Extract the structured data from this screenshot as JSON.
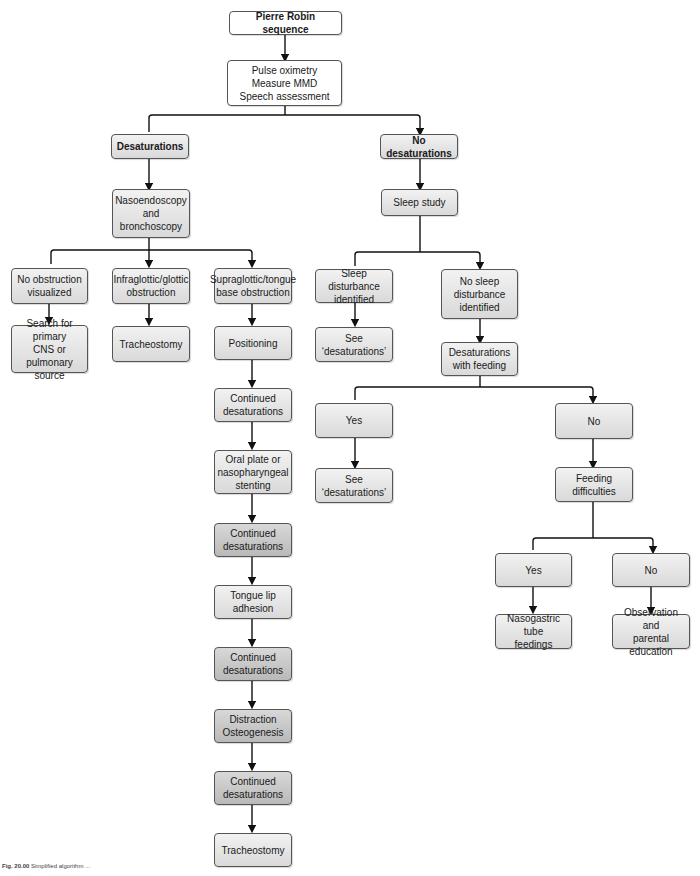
{
  "diagram": {
    "nodes": {
      "root": "Pierre Robin sequence",
      "assess": "Pulse oximetry\nMeasure MMD\nSpeech assessment",
      "desat": "Desaturations",
      "nodesat": "No desaturations",
      "naso": "Nasoendoscopy\nand\nbronchoscopy",
      "noobs": "No obstruction\nvisualized",
      "infra": "Infraglottic/glottic\nobstruction",
      "supra": "Supraglottic/tongue\nbase obstruction",
      "search": "Search for primary\nCNS or\npulmonary source",
      "trach1": "Tracheostomy",
      "position": "Positioning",
      "cont1": "Continued\ndesaturations",
      "oral": "Oral plate or\nnasopharyngeal\nstenting",
      "cont2": "Continued\ndesaturations",
      "tla": "Tongue lip\nadhesion",
      "cont3": "Continued\ndesaturations",
      "distraction": "Distraction\nOsteogenesis",
      "cont4": "Continued\ndesaturations",
      "trach2": "Tracheostomy",
      "sleep": "Sleep study",
      "sleepdist": "Sleep disturbance\nidentified",
      "nosleepdist": "No sleep\ndisturbance\nidentified",
      "seedesat1": "See ‘desaturations’",
      "desatfeed": "Desaturations\nwith feeding",
      "yes1": "Yes",
      "no1": "No",
      "seedesat2": "See ‘desaturations’",
      "feeddiff": "Feeding difficulties",
      "yes2": "Yes",
      "no2": "No",
      "ngt": "Nasogastric tube\nfeedings",
      "observe": "Observation and\nparental education"
    },
    "caption": {
      "label": "Fig. 20.00",
      "text": "Simplified algorithm ..."
    },
    "colors": {
      "box_light": "#e6e6e6",
      "box_dark": "#c4c4c4",
      "border": "#555555",
      "line": "#111111"
    }
  }
}
